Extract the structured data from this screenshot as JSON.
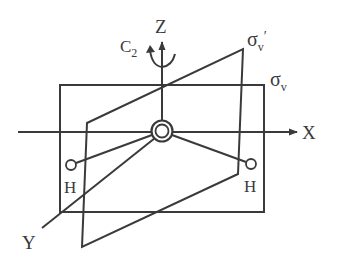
{
  "diagram": {
    "labels": {
      "z_axis": "Z",
      "x_axis": "X",
      "y_axis": "Y",
      "c2": "C",
      "c2_sub": "2",
      "sigma_v_prime": "σ",
      "sigma_v_prime_sub": "v",
      "sigma_v_prime_mark": "′",
      "sigma_v": "σ",
      "sigma_v_sub": "v",
      "h_left": "H",
      "h_right": "H"
    },
    "colors": {
      "line": "#3a3a3a",
      "background": "#ffffff"
    }
  }
}
